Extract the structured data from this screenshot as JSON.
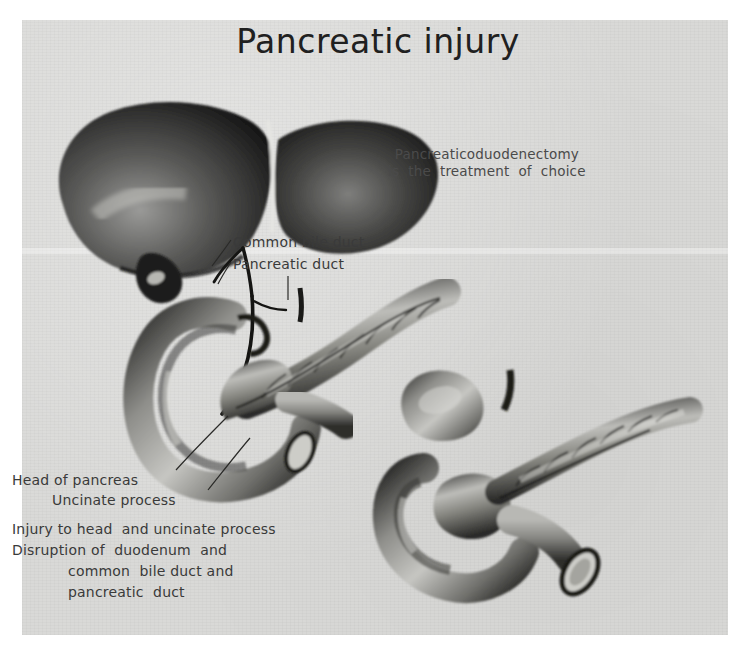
{
  "figure": {
    "title": "Pancreatic injury",
    "background_color": "#d9d9d7",
    "ink_color": "#1f1f1f"
  },
  "annotations": {
    "treatment_line1": "Pancreaticoduodenectomy",
    "treatment_line2": "is  the  treatment  of  choice",
    "common_bile_duct": "Common bile duct",
    "pancreatic_duct": "Pancreatic duct"
  },
  "captions": {
    "head_of_pancreas": "Head of pancreas",
    "uncinate_process": "Uncinate process",
    "injury": "Injury to head  and uncinate process",
    "disruption": "Disruption of  duodenum  and",
    "disruption_cbd": "common  bile duct and",
    "disruption_pd": "pancreatic  duct"
  },
  "illustrations": {
    "upper": {
      "name": "intact-hepatobiliary-pancreatic-anatomy",
      "parts": [
        "liver-right-lobe",
        "liver-left-lobe",
        "falciform-ligament",
        "gallbladder",
        "common-bile-duct",
        "pancreatic-duct",
        "duodenum",
        "pancreas-body-tail",
        "jejunum-stump"
      ]
    },
    "lower": {
      "name": "resected-specimen-disrupted-duodenum",
      "parts": [
        "duodenum-segment",
        "pancreas-head-injured",
        "pancreas-body-tail",
        "cut-bowel-stump",
        "divided-duct"
      ]
    }
  }
}
